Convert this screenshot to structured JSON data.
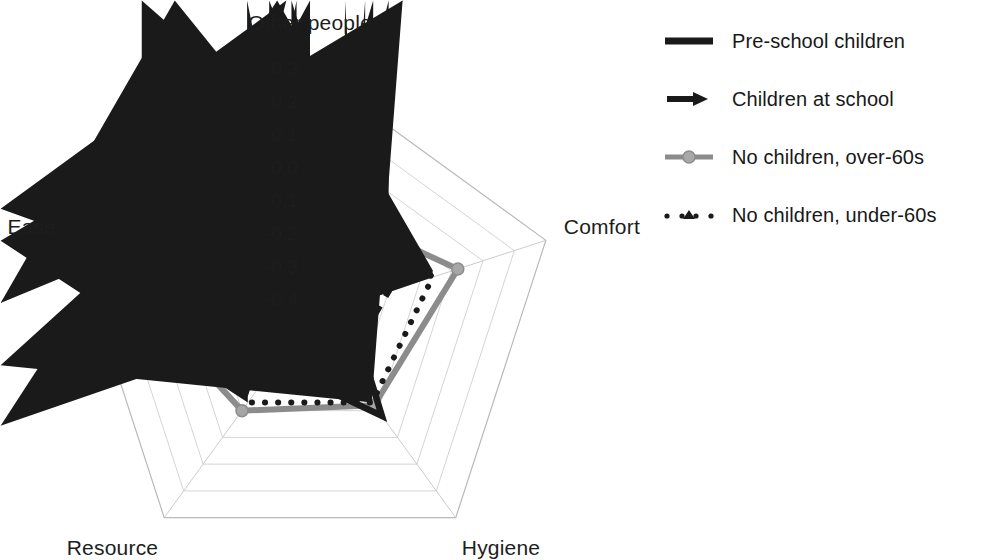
{
  "chart_data": {
    "type": "radar",
    "title": "",
    "categories": [
      "Other people",
      "Comfort",
      "Hygiene",
      "Resource",
      "Ease"
    ],
    "tick_labels": [
      "0.3",
      "0.2",
      "0.1",
      "0.0",
      "-0.1",
      "-0.2",
      "-0.3",
      "-0.4"
    ],
    "tick_values": [
      0.3,
      0.2,
      0.1,
      0.0,
      -0.1,
      -0.2,
      -0.3,
      -0.4
    ],
    "rlim": [
      -0.45,
      0.3
    ],
    "grid": true,
    "legend_position": "right",
    "series": [
      {
        "name": "Pre-school children",
        "style": "solid",
        "color": "#1a1a1a",
        "marker": "none",
        "values": [
          0.3,
          -0.33,
          -0.08,
          -0.27,
          -0.28
        ]
      },
      {
        "name": "Children at school",
        "style": "dashed",
        "color": "#1a1a1a",
        "marker": "diamond",
        "values": [
          0.08,
          -0.2,
          -0.27,
          -0.24,
          -0.25
        ]
      },
      {
        "name": "No children, over-60s",
        "style": "solid",
        "color": "#8c8c8c",
        "marker": "circle",
        "values": [
          -0.1,
          0.02,
          -0.12,
          -0.1,
          0.25
        ]
      },
      {
        "name": "No children, under-60s",
        "style": "dotted",
        "color": "#1a1a1a",
        "marker": "triangle",
        "values": [
          -0.02,
          -0.06,
          -0.13,
          -0.13,
          -0.15
        ]
      }
    ]
  },
  "legend": {
    "entries": [
      {
        "label": "Pre-school children",
        "key": "solid-black-line-icon"
      },
      {
        "label": "Children at school",
        "key": "dashed-black-arrow-line-icon"
      },
      {
        "label": "No children, over-60s",
        "key": "gray-circle-line-icon"
      },
      {
        "label": "No children, under-60s",
        "key": "dotted-black-triangle-line-icon"
      }
    ]
  },
  "axis_labels": {
    "top": "Other people",
    "right": "Comfort",
    "bottom_right": "Hygiene",
    "bottom_left": "Resource",
    "left": "Ease"
  },
  "ticks": {
    "t0": "0.3",
    "t1": "0.2",
    "t2": "0.1",
    "t3": "0.0",
    "t4": "-0.1",
    "t5": "-0.2",
    "t6": "-0.3",
    "t7": "-0.4"
  },
  "top_title": ""
}
